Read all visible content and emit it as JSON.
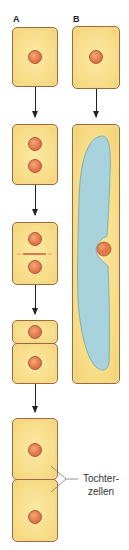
{
  "column_a": {
    "label": "A",
    "steps": [
      {
        "cells": 1,
        "nuclei_per_cell": 1,
        "description": "Ausgangszelle"
      },
      {
        "cells": 1,
        "nuclei_per_cell": 2,
        "description": "Kernteilung"
      },
      {
        "cells": 1,
        "nuclei_per_cell": 2,
        "description": "Zellplatte"
      },
      {
        "cells": 2,
        "nuclei_per_cell": 1,
        "description": "Zellteilung"
      },
      {
        "cells": 2,
        "nuclei_per_cell": 1,
        "description": "Tochterzellen gestreckt"
      }
    ]
  },
  "column_b": {
    "label": "B",
    "steps": [
      {
        "cells": 1,
        "nuclei_per_cell": 1,
        "description": "Ausgangszelle"
      },
      {
        "cells": 1,
        "nuclei_per_cell": 1,
        "description": "Streckungswachstum mit Vakuole"
      }
    ]
  },
  "annotation": {
    "line1": "Tochter-",
    "line2": "zellen"
  },
  "colors": {
    "cytoplasm": "#f7dc86",
    "cell_wall": "#9a6a3a",
    "nucleus": "#e27a4c",
    "vacuole": "#a9d3dc",
    "arrow": "#222222"
  }
}
